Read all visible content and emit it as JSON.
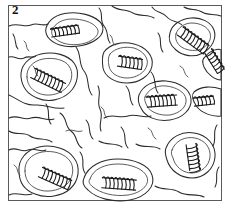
{
  "figure": {
    "panel_label": "2",
    "type": "line-drawing",
    "background_color": "#ffffff",
    "ink_color": "#2b2b2b",
    "frame_color": "#5a5a5a",
    "frame": {
      "x": 8,
      "y": 5,
      "width": 214,
      "height": 196
    },
    "cells": [
      {
        "id": "cell-top-left",
        "coil_label": "coil-1",
        "cx": 66,
        "cy": 31,
        "coil_angle": -8,
        "coil_turns": 7,
        "coil_length": 30
      },
      {
        "id": "cell-mid-left",
        "coil_label": "coil-2",
        "cx": 49,
        "cy": 81,
        "coil_angle": 26,
        "coil_turns": 8,
        "coil_length": 36
      },
      {
        "id": "cell-top-right",
        "coil_label": "coil-3",
        "cx": 194,
        "cy": 41,
        "coil_angle": 36,
        "coil_turns": 8,
        "coil_length": 34
      },
      {
        "id": "cell-center",
        "coil_label": "coil-4",
        "cx": 131,
        "cy": 63,
        "coil_angle": 8,
        "coil_turns": 6,
        "coil_length": 26
      },
      {
        "id": "cell-upper-edge",
        "coil_label": "coil-5",
        "cx": 215,
        "cy": 62,
        "coil_angle": 58,
        "coil_turns": 6,
        "coil_length": 26
      },
      {
        "id": "cell-mid-right",
        "coil_label": "coil-6",
        "cx": 163,
        "cy": 101,
        "coil_angle": -4,
        "coil_turns": 7,
        "coil_length": 32
      },
      {
        "id": "cell-right-edge",
        "coil_label": "coil-7",
        "cx": 205,
        "cy": 101,
        "coil_angle": -6,
        "coil_turns": 5,
        "coil_length": 22
      },
      {
        "id": "cell-low-left",
        "coil_label": "coil-8",
        "cx": 56,
        "cy": 179,
        "coil_angle": 24,
        "coil_turns": 8,
        "coil_length": 34
      },
      {
        "id": "cell-low-center",
        "coil_label": "coil-9",
        "cx": 120,
        "cy": 184,
        "coil_angle": 4,
        "coil_turns": 8,
        "coil_length": 36
      },
      {
        "id": "cell-low-right",
        "coil_label": "coil-10",
        "cx": 193,
        "cy": 158,
        "coil_angle": 82,
        "coil_turns": 7,
        "coil_length": 28
      }
    ]
  }
}
